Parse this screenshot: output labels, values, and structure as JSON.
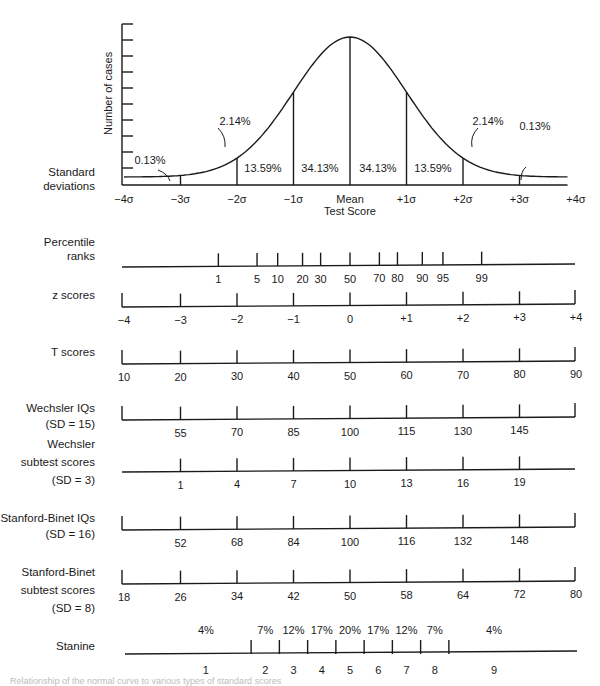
{
  "chart_data": [
    {
      "type": "area",
      "title": "",
      "ylabel": "Number of cases",
      "xlabel": "Test Score",
      "row_label": [
        "Standard",
        "deviations"
      ],
      "x_ticks": [
        "−4σ",
        "−3σ",
        "−2σ",
        "−1σ",
        "Mean",
        "+1σ",
        "+2σ",
        "+3σ",
        "+4σ"
      ],
      "x_values": [
        -4,
        -3,
        -2,
        -1,
        0,
        1,
        2,
        3,
        4
      ],
      "segments": [
        {
          "from": -4,
          "to": -3,
          "percent": "0.13%"
        },
        {
          "from": -3,
          "to": -2,
          "percent": "2.14%"
        },
        {
          "from": -2,
          "to": -1,
          "percent": "13.59%"
        },
        {
          "from": -1,
          "to": 0,
          "percent": "34.13%"
        },
        {
          "from": 0,
          "to": 1,
          "percent": "34.13%"
        },
        {
          "from": 1,
          "to": 2,
          "percent": "13.59%"
        },
        {
          "from": 2,
          "to": 3,
          "percent": "2.14%"
        },
        {
          "from": 3,
          "to": 4,
          "percent": "0.13%"
        }
      ],
      "y_tick_count": 10,
      "grid": false,
      "legend": "none"
    },
    {
      "type": "table",
      "title": "Score scales aligned to the normal curve",
      "rows": [
        {
          "label": [
            "Percentile",
            "ranks"
          ],
          "ticks": [
            "1",
            "5",
            "10",
            "20",
            "30",
            "50",
            "70",
            "80",
            "90",
            "95",
            "99"
          ],
          "z": [
            -2.33,
            -1.645,
            -1.28,
            -0.84,
            -0.52,
            0,
            0.52,
            0.84,
            1.28,
            1.645,
            2.33
          ],
          "end_caps": false
        },
        {
          "label": [
            "z scores"
          ],
          "italic_prefix": "z",
          "ticks": [
            "−4",
            "−3",
            "−2",
            "−1",
            "0",
            "+1",
            "+2",
            "+3",
            "+4"
          ],
          "z": [
            -4,
            -3,
            -2,
            -1,
            0,
            1,
            2,
            3,
            4
          ],
          "end_caps": true
        },
        {
          "label": [
            "T scores"
          ],
          "italic_prefix": "T",
          "ticks": [
            "10",
            "20",
            "30",
            "40",
            "50",
            "60",
            "70",
            "80",
            "90"
          ],
          "z": [
            -4,
            -3,
            -2,
            -1,
            0,
            1,
            2,
            3,
            4
          ],
          "end_caps": true
        },
        {
          "label": [
            "Wechsler IQs",
            "(SD = 15)"
          ],
          "ticks": [
            "55",
            "70",
            "85",
            "100",
            "115",
            "130",
            "145"
          ],
          "z": [
            -3,
            -2,
            -1,
            0,
            1,
            2,
            3
          ],
          "end_caps": true
        },
        {
          "label": [
            "Wechsler",
            "subtest scores",
            "(SD = 3)"
          ],
          "ticks": [
            "1",
            "4",
            "7",
            "10",
            "13",
            "16",
            "19"
          ],
          "z": [
            -3,
            -2,
            -1,
            0,
            1,
            2,
            3
          ],
          "end_caps": false
        },
        {
          "label": [
            "Stanford-Binet IQs",
            "(SD = 16)"
          ],
          "ticks": [
            "52",
            "68",
            "84",
            "100",
            "116",
            "132",
            "148"
          ],
          "z": [
            -3,
            -2,
            -1,
            0,
            1,
            2,
            3
          ],
          "end_caps": true
        },
        {
          "label": [
            "Stanford-Binet",
            "subtest scores",
            "(SD = 8)"
          ],
          "ticks": [
            "18",
            "26",
            "34",
            "42",
            "50",
            "58",
            "64",
            "72",
            "80"
          ],
          "z": [
            -4,
            -3,
            -2,
            -1,
            0,
            1,
            2,
            3,
            4
          ],
          "end_caps": true
        },
        {
          "label": [
            "Stanine"
          ],
          "stanines": [
            "1",
            "2",
            "3",
            "4",
            "5",
            "6",
            "7",
            "8",
            "9"
          ],
          "percents": [
            "4%",
            "7%",
            "12%",
            "17%",
            "20%",
            "17%",
            "12%",
            "7%",
            "4%"
          ],
          "boundaries_z": [
            -1.75,
            -1.25,
            -0.75,
            -0.25,
            0.25,
            0.75,
            1.25,
            1.75
          ]
        }
      ]
    }
  ],
  "curve": {
    "ylabel": "Number of cases",
    "row_label_1": "Standard",
    "row_label_2": "deviations",
    "mean_label": "Mean",
    "xlabel": "Test Score",
    "ticks": [
      "−4σ",
      "−3σ",
      "−2σ",
      "−1σ",
      "",
      "+1σ",
      "+2σ",
      "+3σ",
      "+4σ"
    ],
    "pct": [
      "0.13%",
      "2.14%",
      "13.59%",
      "34.13%",
      "34.13%",
      "13.59%",
      "2.14%",
      "0.13%"
    ]
  },
  "caption": "Relationship of the normal curve to various types of standard scores"
}
